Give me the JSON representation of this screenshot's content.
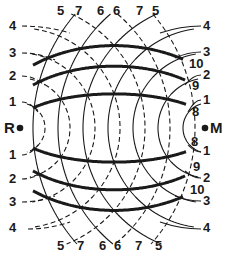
{
  "diagram": {
    "type": "two-source circular wave interference pattern",
    "sources": [
      {
        "id": "R",
        "label": "R",
        "x": 20,
        "y": 128
      },
      {
        "id": "M",
        "label": "M",
        "x": 208,
        "y": 128
      }
    ],
    "spacing": 25,
    "colors": {
      "ink": "#1a1a1a",
      "background": "#ffffff"
    },
    "dashed_circles_center": "R",
    "solid_circles_center": "M",
    "left_labels_top": [
      "4",
      "3",
      "2",
      "1"
    ],
    "left_labels_bottom": [
      "1",
      "2",
      "3",
      "4"
    ],
    "right_labels_top": [
      "4",
      "3",
      "2",
      "1"
    ],
    "right_labels_bottom": [
      "1",
      "2",
      "3",
      "4"
    ],
    "top_pairs": [
      {
        "dashed": "5",
        "solid": "7"
      },
      {
        "dashed": "6",
        "solid": "6"
      },
      {
        "dashed": "7",
        "solid": "5"
      }
    ],
    "bottom_pairs": [
      {
        "dashed": "5",
        "solid": "7"
      },
      {
        "dashed": "6",
        "solid": "6"
      },
      {
        "dashed": "7",
        "solid": "5"
      }
    ],
    "thick_curves_top": [
      "10",
      "9",
      "8"
    ],
    "thick_curves_bottom": [
      "8",
      "9",
      "10"
    ]
  }
}
